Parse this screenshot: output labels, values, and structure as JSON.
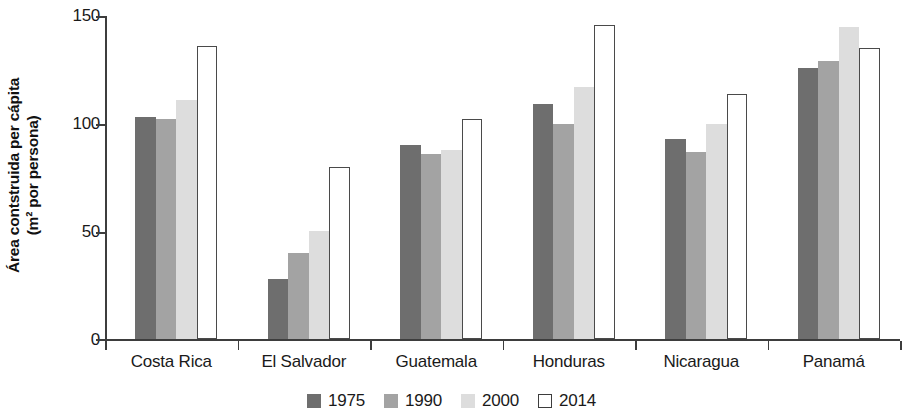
{
  "chart_data": {
    "type": "bar",
    "title": "",
    "subtitle": "",
    "xlabel": "",
    "ylabel": "Área contstruida per cápita (m² por persona)",
    "ylabel_line1": "Área contstruida per cápita",
    "ylabel_line2": "(m² por persona)",
    "ylim": [
      0,
      150
    ],
    "yticks": [
      0,
      50,
      100,
      150
    ],
    "ytick_labels": [
      "0",
      "50",
      "100",
      "150"
    ],
    "grid": false,
    "legend_position": "bottom-center",
    "categories": [
      "Costa Rica",
      "El Salvador",
      "Guatemala",
      "Honduras",
      "Nicaragua",
      "Panamá"
    ],
    "series": [
      {
        "name": "1975",
        "color": "#6e6e6e",
        "values": [
          103,
          28,
          90,
          109,
          93,
          126
        ]
      },
      {
        "name": "1990",
        "color": "#a3a3a3",
        "values": [
          102,
          40,
          86,
          100,
          87,
          129
        ]
      },
      {
        "name": "2000",
        "color": "#dddddd",
        "values": [
          111,
          50,
          88,
          117,
          100,
          145
        ]
      },
      {
        "name": "2014",
        "color": "#ffffff",
        "values": [
          136,
          80,
          102,
          146,
          114,
          135
        ]
      }
    ]
  },
  "axis": {
    "tick_0": "0",
    "tick_50": "50",
    "tick_100": "100",
    "tick_150": "150"
  },
  "legend": {
    "items": [
      {
        "label": "1975"
      },
      {
        "label": "1990"
      },
      {
        "label": "2000"
      },
      {
        "label": "2014"
      }
    ]
  }
}
